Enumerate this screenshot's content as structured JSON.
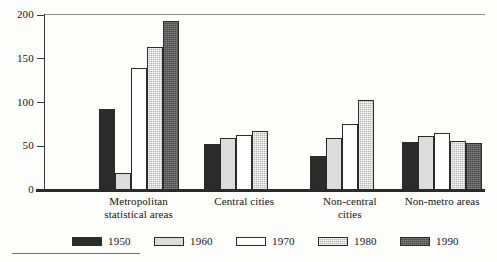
{
  "chart_data": {
    "type": "bar",
    "title": "",
    "subtitle": "",
    "xlabel": "",
    "ylabel": "",
    "ylim": [
      0,
      200
    ],
    "yticks": [
      0,
      50,
      100,
      150,
      200
    ],
    "grid": false,
    "legend_position": "bottom",
    "categories": [
      "Metropolitan statistical areas",
      "Central cities",
      "Non-central cities",
      "Non-metro areas"
    ],
    "category_lines": [
      [
        "Metropolitan",
        "statistical areas"
      ],
      [
        "Central cities"
      ],
      [
        "Non-central",
        "cities"
      ],
      [
        "Non-metro areas"
      ]
    ],
    "series": [
      {
        "name": "1950",
        "color": "#2b2b2b",
        "values": [
          93,
          53,
          39,
          55
        ]
      },
      {
        "name": "1960",
        "color": "#dcdcdc",
        "values": [
          20,
          59,
          59,
          62
        ]
      },
      {
        "name": "1970",
        "color": "#ffffff",
        "values": [
          140,
          63,
          76,
          65
        ]
      },
      {
        "name": "1980",
        "color": "#b4b4b4",
        "values": [
          163,
          67,
          103,
          56
        ]
      },
      {
        "name": "1990",
        "color": "#4a4a4a",
        "values": [
          193,
          null,
          null,
          54
        ]
      }
    ]
  },
  "axis": {
    "y_tick_labels": [
      "0",
      "50",
      "100",
      "150",
      "200"
    ]
  },
  "legend": {
    "entries": [
      {
        "label": "1950",
        "swatch": "legend-swatch-1950"
      },
      {
        "label": "1960",
        "swatch": "legend-swatch-1960"
      },
      {
        "label": "1970",
        "swatch": "legend-swatch-1970"
      },
      {
        "label": "1980",
        "swatch": "legend-swatch-1980"
      },
      {
        "label": "1990",
        "swatch": "legend-swatch-1990"
      }
    ]
  }
}
